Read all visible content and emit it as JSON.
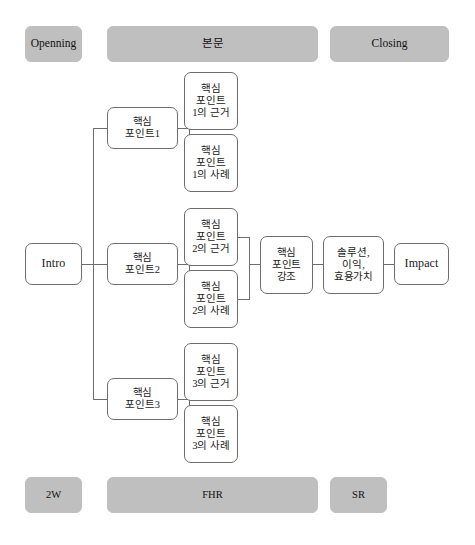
{
  "diagram": {
    "title_row": {
      "opening": "Openning",
      "body": "본문",
      "closing": "Closing"
    },
    "footer_row": {
      "left": "2W",
      "center": "FHR",
      "right": "SR"
    },
    "intro": "Intro",
    "branches": [
      {
        "main": "핵심\n포인트1",
        "evidence": "핵심\n포인트\n1의 근거",
        "example": "핵심\n포인트\n1의 사례"
      },
      {
        "main": "핵심\n포인트2",
        "evidence": "핵심\n포인트\n2의 근거",
        "example": "핵심\n포인트\n2의 사례"
      },
      {
        "main": "핵심\n포인트3",
        "evidence": "핵심\n포인트\n3의 근거",
        "example": "핵심\n포인트\n3의 사례"
      }
    ],
    "chain": {
      "emphasis": "핵심\n포인트\n강조",
      "value": "솔루션,\n이익,\n효용가치",
      "impact": "Impact"
    },
    "colors": {
      "banner_fill": "#bfbfbf",
      "box_stroke": "#6d6d6d",
      "box_fill": "#ffffff",
      "page_background": "#ffffff",
      "text": "#1a1a1a"
    }
  }
}
